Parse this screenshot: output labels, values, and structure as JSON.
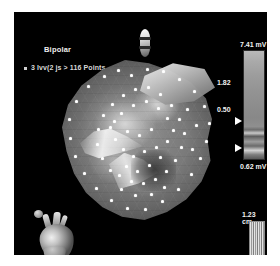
{
  "window": {
    "title": "Electroanatomic Voltage Map",
    "background_color": "#000000",
    "page_border_color": "#ffffff"
  },
  "map": {
    "mode_label": "Bipolar",
    "points_label": "3 lvv(2 js > 116 Points",
    "points_count": 116,
    "surface_type": "3d-voltage-mesh",
    "point_marker_color": "#ffffff",
    "point_markers": [
      {
        "x": 68,
        "y": 14
      },
      {
        "x": 84,
        "y": 8
      },
      {
        "x": 100,
        "y": 10
      },
      {
        "x": 116,
        "y": 18
      },
      {
        "x": 131,
        "y": 30
      },
      {
        "x": 141,
        "y": 45
      },
      {
        "x": 146,
        "y": 62
      },
      {
        "x": 143,
        "y": 80
      },
      {
        "x": 137,
        "y": 97
      },
      {
        "x": 128,
        "y": 113
      },
      {
        "x": 115,
        "y": 128
      },
      {
        "x": 99,
        "y": 140
      },
      {
        "x": 82,
        "y": 148
      },
      {
        "x": 64,
        "y": 147
      },
      {
        "x": 48,
        "y": 139
      },
      {
        "x": 33,
        "y": 127
      },
      {
        "x": 21,
        "y": 112
      },
      {
        "x": 12,
        "y": 95
      },
      {
        "x": 7,
        "y": 77
      },
      {
        "x": 6,
        "y": 58
      },
      {
        "x": 13,
        "y": 40
      },
      {
        "x": 25,
        "y": 25
      },
      {
        "x": 41,
        "y": 15
      },
      {
        "x": 55,
        "y": 9
      },
      {
        "x": 58,
        "y": 52
      },
      {
        "x": 70,
        "y": 44
      },
      {
        "x": 83,
        "y": 40
      },
      {
        "x": 95,
        "y": 47
      },
      {
        "x": 104,
        "y": 57
      },
      {
        "x": 110,
        "y": 69
      },
      {
        "x": 104,
        "y": 80
      },
      {
        "x": 93,
        "y": 86
      },
      {
        "x": 81,
        "y": 90
      },
      {
        "x": 70,
        "y": 95
      },
      {
        "x": 60,
        "y": 88
      },
      {
        "x": 52,
        "y": 78
      },
      {
        "x": 47,
        "y": 66
      },
      {
        "x": 51,
        "y": 60
      },
      {
        "x": 64,
        "y": 70
      },
      {
        "x": 76,
        "y": 74
      },
      {
        "x": 88,
        "y": 68
      },
      {
        "x": 97,
        "y": 96
      },
      {
        "x": 86,
        "y": 104
      },
      {
        "x": 74,
        "y": 110
      },
      {
        "x": 63,
        "y": 105
      },
      {
        "x": 56,
        "y": 114
      },
      {
        "x": 68,
        "y": 120
      },
      {
        "x": 80,
        "y": 122
      },
      {
        "x": 92,
        "y": 118
      },
      {
        "x": 103,
        "y": 110
      },
      {
        "x": 112,
        "y": 99
      },
      {
        "x": 118,
        "y": 86
      },
      {
        "x": 121,
        "y": 72
      },
      {
        "x": 116,
        "y": 58
      },
      {
        "x": 108,
        "y": 44
      },
      {
        "x": 97,
        "y": 33
      },
      {
        "x": 85,
        "y": 26
      },
      {
        "x": 72,
        "y": 28
      },
      {
        "x": 60,
        "y": 34
      },
      {
        "x": 49,
        "y": 43
      },
      {
        "x": 40,
        "y": 54
      },
      {
        "x": 35,
        "y": 68
      },
      {
        "x": 34,
        "y": 83
      },
      {
        "x": 39,
        "y": 97
      },
      {
        "x": 47,
        "y": 109
      },
      {
        "x": 58,
        "y": 128
      },
      {
        "x": 72,
        "y": 134
      },
      {
        "x": 88,
        "y": 133
      },
      {
        "x": 101,
        "y": 126
      },
      {
        "x": 124,
        "y": 48
      },
      {
        "x": 133,
        "y": 64
      },
      {
        "x": 129,
        "y": 88
      }
    ]
  },
  "catheter": {
    "marker_name": "catheter-tip-marker",
    "band_count": 2
  },
  "orientation": {
    "icon_name": "heart-orientation-icon",
    "description": "3D heart model orientation reference"
  },
  "voltage_scale": {
    "title": "Bipolar voltage scale",
    "max_value": "7.41 mV",
    "high_threshold": "1.82",
    "low_threshold": "0.50",
    "min_value": "0.62 mV",
    "unit": "mV",
    "slider_color": "#ffffff"
  },
  "ruler": {
    "label": "1.23 cm",
    "value": 1.23,
    "unit": "cm"
  },
  "chart_data": {
    "type": "heatmap",
    "subtitle": "3 lvv(2 js > 116 Points",
    "colormap": "grayscale",
    "colorbar": {
      "label": "Bipolar voltage (mV)",
      "max": 7.41,
      "min": 0.62,
      "ticks": [
        7.41,
        1.82,
        0.5,
        0.62
      ],
      "tick_labels": [
        "7.41 mV",
        "1.82",
        "0.50",
        "0.62 mV"
      ],
      "thresholds": {
        "healthy_above": 1.82,
        "scar_below": 0.5
      },
      "position": "right"
    },
    "scalebar": {
      "value": 1.23,
      "unit": "cm",
      "position": "bottom-right"
    },
    "annotations": [
      "Bipolar",
      "3 lvv(2 js > 116 Points"
    ],
    "n_points": 116,
    "grid": false,
    "legend_position": "right"
  }
}
